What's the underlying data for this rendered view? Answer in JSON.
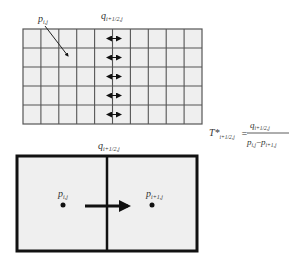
{
  "grid": {
    "columns": 10,
    "rows": 5,
    "fill_color": "#efefef",
    "line_color": "#555555",
    "label_p": {
      "base": "p",
      "sub": "i,j"
    },
    "label_q": {
      "base": "q",
      "sub": "i+1/2,j"
    },
    "flux_arrow_rows": 5
  },
  "formula": {
    "lhs_base": "T*",
    "lhs_sub": "i+1/2,j",
    "equals": "=",
    "numerator_base": "q",
    "numerator_sub": "i+1/2,j",
    "denominator_left_base": "p",
    "denominator_left_sub": "i,j",
    "minus": "−",
    "denominator_right_base": "p",
    "denominator_right_sub": "i+1,j"
  },
  "detail": {
    "label_q": {
      "base": "q",
      "sub": "i+1/2,j"
    },
    "left_cell_label": {
      "base": "p",
      "sub": "i,j"
    },
    "right_cell_label": {
      "base": "p",
      "sub": "i+1,j"
    },
    "fill_color": "#efefef",
    "border_color": "#111111"
  }
}
